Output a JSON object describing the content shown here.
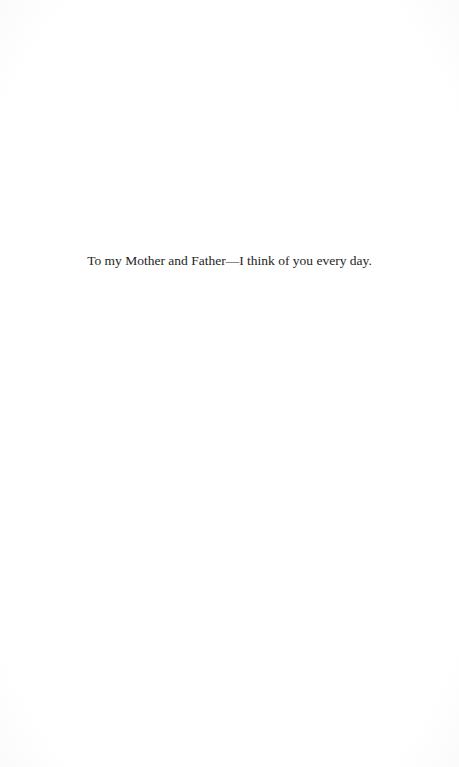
{
  "page": {
    "type": "dedication",
    "background_color": "#ffffff",
    "text_color": "#1e1e1e"
  },
  "dedication": {
    "text": "To my Mother and Father—I think of you every day."
  }
}
